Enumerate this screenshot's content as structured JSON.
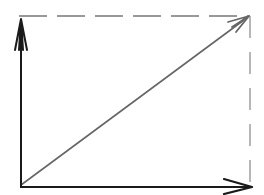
{
  "diagram": {
    "type": "vector-decomposition",
    "elements": {
      "x_axis": {
        "from": [
          21,
          187
        ],
        "to": [
          252,
          187
        ],
        "style": "solid",
        "color": "#1a1a1a",
        "arrowhead": "end"
      },
      "y_axis": {
        "from": [
          21,
          187
        ],
        "to": [
          21,
          18
        ],
        "style": "solid",
        "color": "#1a1a1a",
        "arrowhead": "end"
      },
      "resultant": {
        "from": [
          21,
          185
        ],
        "to": [
          249,
          16
        ],
        "style": "solid",
        "color": "#666666",
        "arrowhead": "end"
      },
      "top_projection": {
        "from": [
          19,
          16
        ],
        "to": [
          249,
          16
        ],
        "style": "dashed",
        "color": "#777777"
      },
      "right_projection": {
        "from": [
          250,
          16
        ],
        "to": [
          250,
          185
        ],
        "style": "dashed",
        "color": "#888888"
      }
    },
    "colors": {
      "axis": "#1a1a1a",
      "resultant": "#666666",
      "dashed": "#808080",
      "background": "#ffffff"
    }
  }
}
